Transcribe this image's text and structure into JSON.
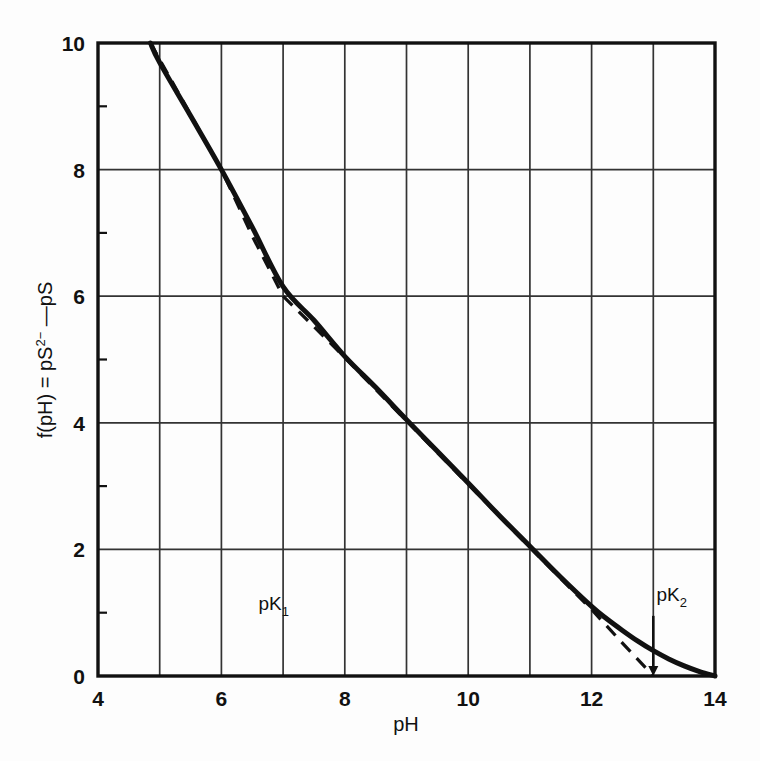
{
  "chart_data": {
    "type": "line",
    "title": "",
    "xlabel": "pH",
    "ylabel_parts": {
      "lead": "f(pH) = pS",
      "sup": "2−",
      "tail": " —pS"
    },
    "ylabel": "f(pH) = pS2− —pS",
    "xlim": [
      4,
      14
    ],
    "ylim": [
      0,
      10
    ],
    "x_ticks_major": [
      4,
      6,
      8,
      10,
      12,
      14
    ],
    "x_tick_labels": [
      "4",
      "6",
      "8",
      "10",
      "12",
      "14"
    ],
    "x_gridlines": [
      5,
      6,
      7,
      8,
      9,
      10,
      11,
      12,
      13
    ],
    "y_ticks_major": [
      0,
      2,
      4,
      6,
      8,
      10
    ],
    "y_tick_labels": [
      "0",
      "2",
      "4",
      "6",
      "8",
      "10"
    ],
    "y_gridlines": [
      2,
      4,
      6,
      8
    ],
    "grid": true,
    "legend_position": "none",
    "series": [
      {
        "name": "exact-curve",
        "style": "solid",
        "color": "#111111",
        "x": [
          4.85,
          5.0,
          5.5,
          6.0,
          6.5,
          7.0,
          7.5,
          8.0,
          8.5,
          9.0,
          9.5,
          10.0,
          10.5,
          11.0,
          11.5,
          12.0,
          12.25,
          12.5,
          12.75,
          13.0,
          13.25,
          13.5,
          13.75,
          14.0
        ],
        "y": [
          10.0,
          9.69,
          8.85,
          8.0,
          7.09,
          6.15,
          5.62,
          5.05,
          4.56,
          4.05,
          3.55,
          3.05,
          2.54,
          2.05,
          1.56,
          1.1,
          0.9,
          0.72,
          0.55,
          0.4,
          0.27,
          0.16,
          0.07,
          0.0
        ]
      },
      {
        "name": "asymptote-approximation",
        "style": "dashed",
        "color": "#111111",
        "x": [
          4.85,
          6.0,
          6.5,
          7.0,
          7.5,
          8.0,
          9.0,
          10.0,
          11.0,
          12.0,
          12.5,
          13.0
        ],
        "y": [
          10.0,
          8.0,
          6.95,
          6.0,
          5.52,
          5.03,
          4.03,
          3.03,
          2.03,
          1.05,
          0.52,
          0.0
        ]
      }
    ],
    "annotations": [
      {
        "name": "pK1",
        "label_lead": "pK",
        "label_sub": "1",
        "x": 6.6,
        "y": 1.05,
        "marker": "gridline-at-7",
        "has_arrow": false
      },
      {
        "name": "pK2",
        "label_lead": "pK",
        "label_sub": "2",
        "x": 13.05,
        "y": 1.18,
        "marker": "arrow-down-to-axis",
        "arrow_x": 13.0,
        "arrow_from_y": 0.95,
        "arrow_to_y": 0.0,
        "has_arrow": true
      }
    ],
    "colors": {
      "background": "#fdfdfd",
      "ink": "#111111",
      "grid": "#333333",
      "frame": "#111111"
    }
  }
}
